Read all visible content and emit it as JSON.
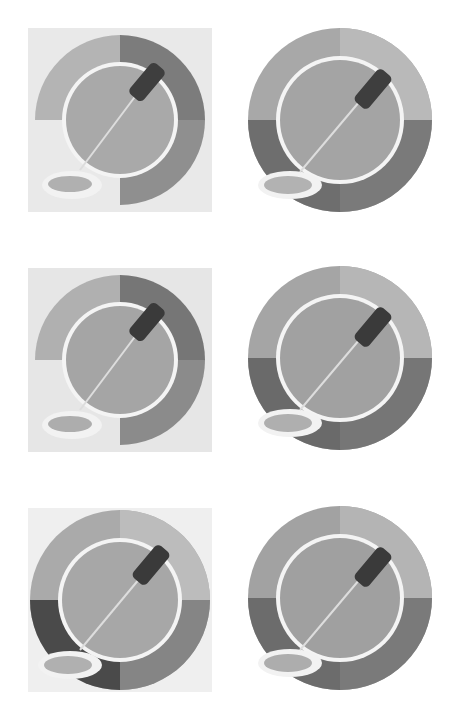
{
  "gallery": {
    "description": "Six grayscale variants of an eyedropper over a segmented color-wheel icon",
    "icons": [
      {
        "id": 1,
        "style": "square-bg",
        "seg_colors": [
          "#b4b4b4",
          "#7c7c7c",
          "#8f8f8f",
          "#e4e4e4"
        ],
        "inner": "#a9a9a9",
        "bg": "#e9e9e9"
      },
      {
        "id": 2,
        "style": "round",
        "seg_colors": [
          "#a8a8a8",
          "#b9b9b9",
          "#7a7a7a",
          "#6e6e6e"
        ],
        "inner": "#a4a4a4",
        "bg": null
      },
      {
        "id": 3,
        "style": "square-bg",
        "seg_colors": [
          "#b0b0b0",
          "#767676",
          "#8b8b8b",
          "#e0e0e0"
        ],
        "inner": "#a5a5a5",
        "bg": "#e6e6e6"
      },
      {
        "id": 4,
        "style": "round",
        "seg_colors": [
          "#a5a5a5",
          "#b6b6b6",
          "#767676",
          "#6a6a6a"
        ],
        "inner": "#a1a1a1",
        "bg": null
      },
      {
        "id": 5,
        "style": "square-bg",
        "seg_colors": [
          "#aaaaaa",
          "#bcbcbc",
          "#858585",
          "#4a4a4a"
        ],
        "inner": "#a7a7a7",
        "bg": "#efefef"
      },
      {
        "id": 6,
        "style": "round",
        "seg_colors": [
          "#a2a2a2",
          "#b4b4b4",
          "#7a7a7a",
          "#6c6c6c"
        ],
        "inner": "#a0a0a0",
        "bg": null
      }
    ]
  }
}
